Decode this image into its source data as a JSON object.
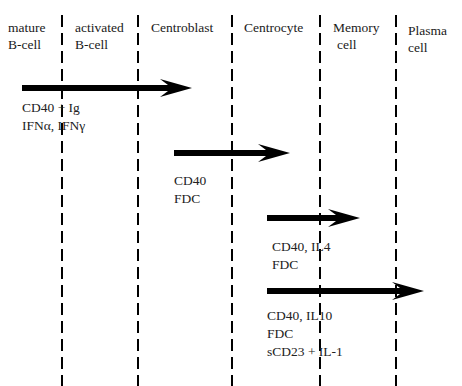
{
  "stages": [
    {
      "line1": "mature",
      "line2": "B-cell"
    },
    {
      "line1": "activated",
      "line2": "B-cell"
    },
    {
      "line1": "Centroblast",
      "line2": ""
    },
    {
      "line1": "Centrocyte",
      "line2": ""
    },
    {
      "line1": "Memory",
      "line2": "cell"
    },
    {
      "line1": "Plasma",
      "line2": "cell"
    }
  ],
  "boundaries_x": [
    62,
    138,
    232,
    320,
    396
  ],
  "arrows": [
    {
      "x1": 22,
      "x2": 192,
      "y": 88,
      "labels": [
        "CD40 + Ig",
        "IFNα, IFNγ"
      ]
    },
    {
      "x1": 174,
      "x2": 290,
      "y": 153,
      "labels": [
        "CD40",
        "FDC"
      ]
    },
    {
      "x1": 267,
      "x2": 360,
      "y": 218,
      "labels": [
        "CD40, IL4",
        "FDC"
      ]
    },
    {
      "x1": 267,
      "x2": 424,
      "y": 291,
      "labels": [
        "CD40, IL10",
        "FDC",
        "sCD23 + IL-1"
      ]
    }
  ],
  "colors": {
    "ink": "#000000",
    "text": "#222222",
    "background": "#ffffff"
  }
}
